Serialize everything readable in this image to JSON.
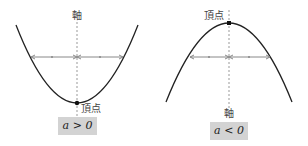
{
  "diagrams": [
    {
      "id": "upward",
      "axis_label": "軸",
      "vertex_label": "頂点",
      "condition": "a > 0",
      "curve_color": "#222222",
      "axis_color": "#999999",
      "arrow_color": "#888888"
    },
    {
      "id": "downward",
      "axis_label": "軸",
      "vertex_label": "頂点",
      "condition": "a < 0",
      "curve_color": "#222222",
      "axis_color": "#999999",
      "arrow_color": "#888888"
    }
  ],
  "box_color": "#d3d3d3"
}
